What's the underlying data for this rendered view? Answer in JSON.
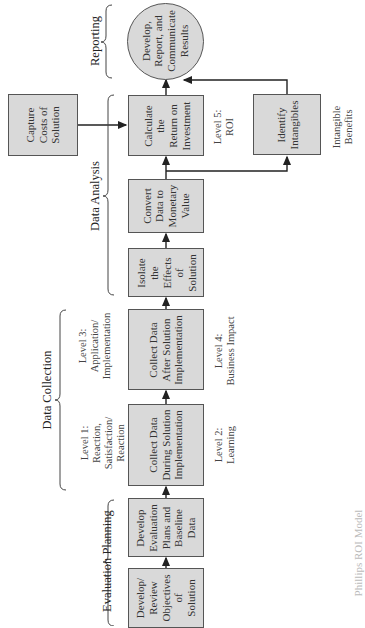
{
  "diagram": {
    "orientation": "rotated-90-ccw",
    "colors": {
      "box_fill": "#d9d9d9",
      "box_border": "#555555",
      "line": "#222222"
    },
    "sections": {
      "evaluation_planning": "Evaluation Planning",
      "data_collection": "Data Collection",
      "data_analysis": "Data Analysis",
      "reporting": "Reporting"
    },
    "boxes": {
      "develop_review": "Develop/\nReview\nObjectives\nof\nSolution",
      "develop_evaluation": "Develop\nEvaluation\nPlans and\nBaseline\nData",
      "collect_during": "Collect Data\nDuring Solution\nImplementation",
      "collect_after": "Collect Data\nAfter Solution\nImplementation",
      "isolate": "Isolate\nthe\nEffects\nof\nSolution",
      "convert": "Convert\nData to\nMonetary\nValue",
      "calculate_roi": "Calculate\nthe\nReturn on\nInvestment",
      "identify_intangibles": "Identify\nIntangibles",
      "capture_costs": "Capture\nCosts of\nSolution",
      "report": "Develop,\nReport, and\nCommunicate\nResults"
    },
    "levels": {
      "level1": "Level 1:\nReaction,\nSatisfaction/\nReaction",
      "level2": "Level 2:\nLearning",
      "level3": "Level 3:\nApplication/\nImplementation",
      "level4": "Level 4:\nBusiness Impact",
      "level5": "Level 5:\nROI",
      "intangible": "Intangible\nBenefits"
    },
    "caption": "Phillips ROI Model"
  }
}
